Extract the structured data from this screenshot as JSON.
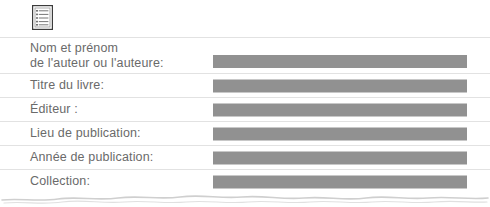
{
  "document": {
    "title_icon": "document-lines-icon",
    "accent_colors": {
      "label_text": "#6a6a6a",
      "separator": "#e2e2e2",
      "redaction_bar": "#919191",
      "page_background": "#ffffff",
      "icon_outline": "#3c3c3c"
    },
    "rows": [
      {
        "id": "author-name",
        "label_lines": [
          "Nom et prénom",
          "de l'auteur ou l'auteure:"
        ],
        "value": "",
        "redacted": true
      },
      {
        "id": "book-title",
        "label_lines": [
          "Titre du livre:"
        ],
        "value": "",
        "redacted": true
      },
      {
        "id": "publisher",
        "label_lines": [
          "Éditeur :"
        ],
        "value": "",
        "redacted": true
      },
      {
        "id": "place-of-publication",
        "label_lines": [
          "Lieu de publication:"
        ],
        "value": "",
        "redacted": true
      },
      {
        "id": "year-of-publication",
        "label_lines": [
          "Année de publication:"
        ],
        "value": "",
        "redacted": true
      },
      {
        "id": "collection",
        "label_lines": [
          "Collection:"
        ],
        "value": "",
        "redacted": true
      }
    ]
  }
}
